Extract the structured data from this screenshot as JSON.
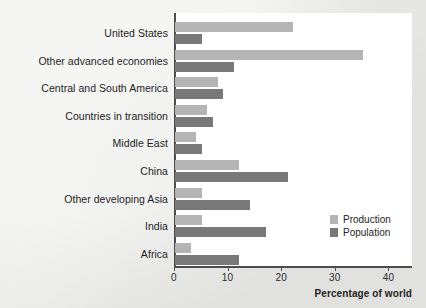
{
  "chart_data": {
    "type": "bar",
    "orientation": "horizontal",
    "title": "",
    "xlabel": "Percentage of world",
    "ylabel": "",
    "xlim": [
      0,
      43
    ],
    "xticks": [
      0,
      10,
      20,
      30,
      40
    ],
    "xtick_labels": [
      "0",
      "10",
      "20",
      "30",
      "40"
    ],
    "grid": false,
    "legend_position": "lower right",
    "categories": [
      "United States",
      "Other advanced economies",
      "Central and South America",
      "Countries in transition",
      "Middle East",
      "China",
      "Other developing Asia",
      "India",
      "Africa"
    ],
    "series": [
      {
        "name": "Production",
        "color": "#b4b4b4",
        "values": [
          22,
          35,
          8,
          6,
          4,
          12,
          5,
          5,
          3
        ]
      },
      {
        "name": "Population",
        "color": "#787878",
        "values": [
          5,
          11,
          9,
          7,
          5,
          21,
          14,
          17,
          12
        ]
      }
    ]
  },
  "legend": {
    "items": [
      {
        "label": "Production",
        "color": "#b4b4b4"
      },
      {
        "label": "Population",
        "color": "#787878"
      }
    ]
  },
  "colors": {
    "background": "#e9e9e7",
    "panel": "#ffffff",
    "axis": "#4c4c4c",
    "text": "#1e1e1e",
    "production": "#b4b4b4",
    "population": "#787878"
  }
}
